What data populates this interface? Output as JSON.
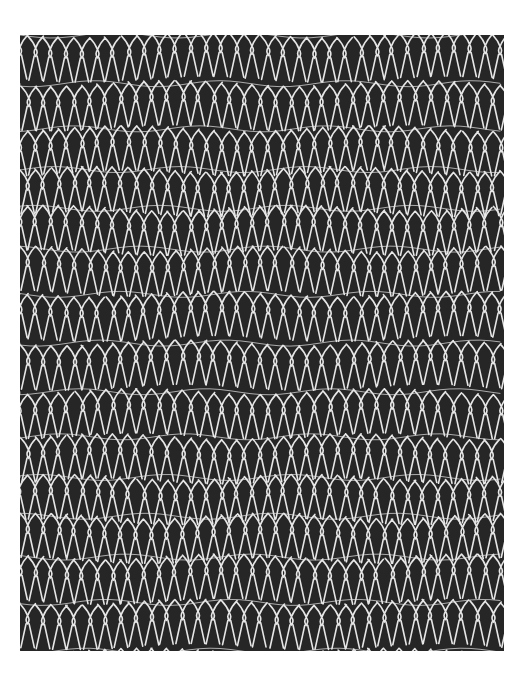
{
  "image": {
    "subject": "knitted mesh texture",
    "description": "Black-and-white photograph of a white knitted net/mesh against a dark background, rows of elongated loops with wavy horizontal bands",
    "colors": {
      "background": "#262626",
      "thread": "#e6e6e6",
      "page": "#ffffff"
    }
  }
}
